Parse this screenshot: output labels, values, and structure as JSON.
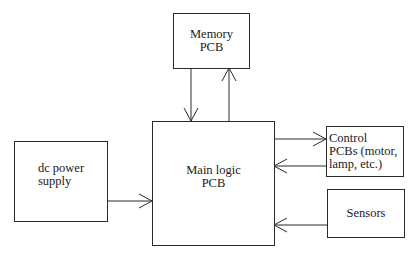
{
  "diagram": {
    "type": "block-diagram",
    "nodes": [
      {
        "id": "memory",
        "label": "Memory\nPCB"
      },
      {
        "id": "main",
        "label": "Main logic\nPCB"
      },
      {
        "id": "power",
        "label": "dc power\nsupply"
      },
      {
        "id": "control",
        "label": "Control\nPCBs (motor,\nlamp, etc.)"
      },
      {
        "id": "sensors",
        "label": "Sensors"
      }
    ],
    "edges": [
      {
        "from": "memory",
        "to": "main"
      },
      {
        "from": "main",
        "to": "memory"
      },
      {
        "from": "power",
        "to": "main"
      },
      {
        "from": "main",
        "to": "control"
      },
      {
        "from": "control",
        "to": "main"
      },
      {
        "from": "sensors",
        "to": "main"
      }
    ]
  },
  "colors": {
    "line": "#2a2a2a",
    "background": "#ffffff"
  }
}
